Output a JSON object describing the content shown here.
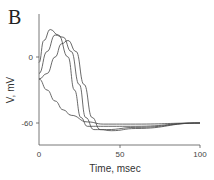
{
  "panel_label": "B",
  "chart_data": {
    "type": "line",
    "title": "",
    "xlabel": "Time, msec",
    "ylabel": "V, mV",
    "xlim": [
      0,
      100
    ],
    "ylim": [
      -80,
      30
    ],
    "x_ticks": [
      "0",
      "50",
      "100"
    ],
    "y_ticks": [
      "0",
      "-60"
    ],
    "grid": false,
    "legend": null,
    "series": [
      {
        "name": "trace-1",
        "x": [
          0,
          3,
          7,
          12,
          18,
          22,
          26,
          30,
          40,
          60,
          100
        ],
        "y": [
          -5,
          15,
          25,
          20,
          0,
          -30,
          -55,
          -63,
          -63,
          -63,
          -60
        ]
      },
      {
        "name": "trace-2",
        "x": [
          0,
          5,
          10,
          15,
          20,
          25,
          29,
          34,
          42,
          60,
          100
        ],
        "y": [
          -15,
          5,
          20,
          18,
          5,
          -25,
          -55,
          -66,
          -66,
          -64,
          -60
        ]
      },
      {
        "name": "trace-3",
        "x": [
          0,
          5,
          10,
          14,
          18,
          23,
          28,
          33,
          38,
          45,
          60,
          100
        ],
        "y": [
          -20,
          -15,
          0,
          12,
          15,
          5,
          -25,
          -55,
          -66,
          -67,
          -65,
          -60
        ]
      },
      {
        "name": "trace-passive",
        "x": [
          0,
          5,
          10,
          15,
          20,
          30,
          40,
          60,
          100
        ],
        "y": [
          -20,
          -30,
          -40,
          -48,
          -53,
          -59,
          -61,
          -61,
          -60
        ]
      }
    ]
  }
}
